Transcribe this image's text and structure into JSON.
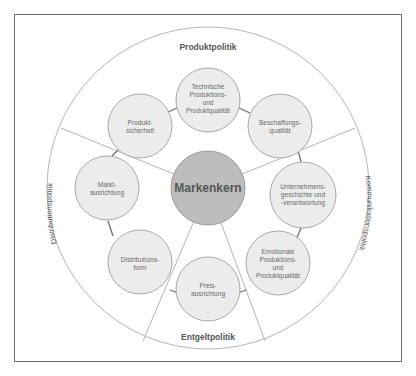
{
  "diagram": {
    "center": {
      "label": "Markenkern",
      "fill": "#bdbdbd"
    },
    "segments": [
      {
        "id": "produktpolitik",
        "label": "Produktpolitik"
      },
      {
        "id": "kommunikationspolitik",
        "label": "Kommunikationspolitik"
      },
      {
        "id": "entgeltpolitik",
        "label": "Entgeltpolitik"
      },
      {
        "id": "distributionspolitik",
        "label": "Distributionspolitik"
      }
    ],
    "nodes": [
      {
        "id": "technische",
        "lines": [
          "Technische",
          "Produktions-",
          "und",
          "Produktqualität"
        ]
      },
      {
        "id": "beschaffung",
        "lines": [
          "Beschaffungs-",
          "qualität"
        ]
      },
      {
        "id": "unternehmen",
        "lines": [
          "Unternehmens-",
          "geschichte und",
          "-verantwortung"
        ]
      },
      {
        "id": "emotionale",
        "lines": [
          "Emotionale",
          "Produktions-",
          "und",
          "Produktqualität"
        ]
      },
      {
        "id": "preis",
        "lines": [
          "Preis-",
          "ausrichtung"
        ]
      },
      {
        "id": "distributionsform",
        "lines": [
          "Distributions-",
          "form"
        ]
      },
      {
        "id": "markt",
        "lines": [
          "Markt-",
          "ausrichtung"
        ]
      },
      {
        "id": "produktsicherheit",
        "lines": [
          "Produkt-",
          "sicherheit"
        ]
      }
    ],
    "colors": {
      "node_fill": "#ececec",
      "node_stroke": "#a8a8a8",
      "connector": "#6e6e6e",
      "outline": "#b5b5b5",
      "text": "#6a6a6a",
      "segment_text": "#555555"
    }
  }
}
